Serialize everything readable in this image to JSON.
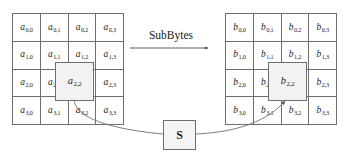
{
  "diagram": {
    "operation_label": "SubBytes",
    "sbox_label": "S",
    "colors": {
      "line": "#6e6e6e",
      "text": "#1a1a1a",
      "highlight_fill": "#f2f2f2",
      "background": "#ffffff"
    }
  },
  "input_matrix": {
    "name": "state-matrix-a",
    "symbol": "a",
    "rows": 4,
    "cols": 4,
    "cells": [
      {
        "sym": "a",
        "sub": "0,0"
      },
      {
        "sym": "a",
        "sub": "0,1"
      },
      {
        "sym": "a",
        "sub": "0,2"
      },
      {
        "sym": "a",
        "sub": "0,3"
      },
      {
        "sym": "a",
        "sub": "1,0"
      },
      {
        "sym": "a",
        "sub": "1,1"
      },
      {
        "sym": "a",
        "sub": "1,2"
      },
      {
        "sym": "a",
        "sub": "1,3"
      },
      {
        "sym": "a",
        "sub": "2,0"
      },
      {
        "sym": "a",
        "sub": "2,1"
      },
      {
        "sym": "a",
        "sub": "2,2"
      },
      {
        "sym": "a",
        "sub": "2,3"
      },
      {
        "sym": "a",
        "sub": "3,0"
      },
      {
        "sym": "a",
        "sub": "3,1"
      },
      {
        "sym": "a",
        "sub": "3,2"
      },
      {
        "sym": "a",
        "sub": "3,3"
      }
    ],
    "highlighted": {
      "sym": "a",
      "sub": "2,2",
      "row": 2,
      "col": 2
    }
  },
  "output_matrix": {
    "name": "state-matrix-b",
    "symbol": "b",
    "rows": 4,
    "cols": 4,
    "cells": [
      {
        "sym": "b",
        "sub": "0,0"
      },
      {
        "sym": "b",
        "sub": "0,1"
      },
      {
        "sym": "b",
        "sub": "0,2"
      },
      {
        "sym": "b",
        "sub": "0,3"
      },
      {
        "sym": "b",
        "sub": "1,0"
      },
      {
        "sym": "b",
        "sub": "1,1"
      },
      {
        "sym": "b",
        "sub": "1,2"
      },
      {
        "sym": "b",
        "sub": "1,3"
      },
      {
        "sym": "b",
        "sub": "2,0"
      },
      {
        "sym": "b",
        "sub": "2,1"
      },
      {
        "sym": "b",
        "sub": "2,2"
      },
      {
        "sym": "b",
        "sub": "2,3"
      },
      {
        "sym": "b",
        "sub": "3,0"
      },
      {
        "sym": "b",
        "sub": "3,1"
      },
      {
        "sym": "b",
        "sub": "3,2"
      },
      {
        "sym": "b",
        "sub": "3,3"
      }
    ],
    "highlighted": {
      "sym": "b",
      "sub": "2,2",
      "row": 2,
      "col": 2
    }
  }
}
